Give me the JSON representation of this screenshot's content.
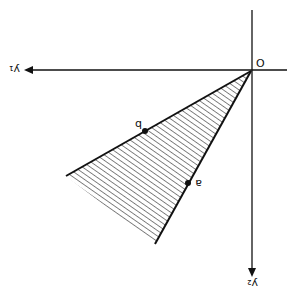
{
  "figure": {
    "orientation_note": "image is rotated 180 degrees",
    "origin_label": "O",
    "axes": [
      {
        "name": "y1",
        "label": "y₁",
        "direction": "horizontal"
      },
      {
        "name": "y2",
        "label": "y₂",
        "direction": "vertical"
      }
    ],
    "points": [
      {
        "name": "a",
        "label": "a",
        "on_ray": "lower edge of cone"
      },
      {
        "name": "b",
        "label": "b",
        "on_ray": "upper edge of cone"
      }
    ],
    "region": {
      "type": "convex cone",
      "fill": "hatched"
    },
    "caption": "",
    "colors": {
      "ink": "#111111",
      "background": "#ffffff"
    }
  }
}
